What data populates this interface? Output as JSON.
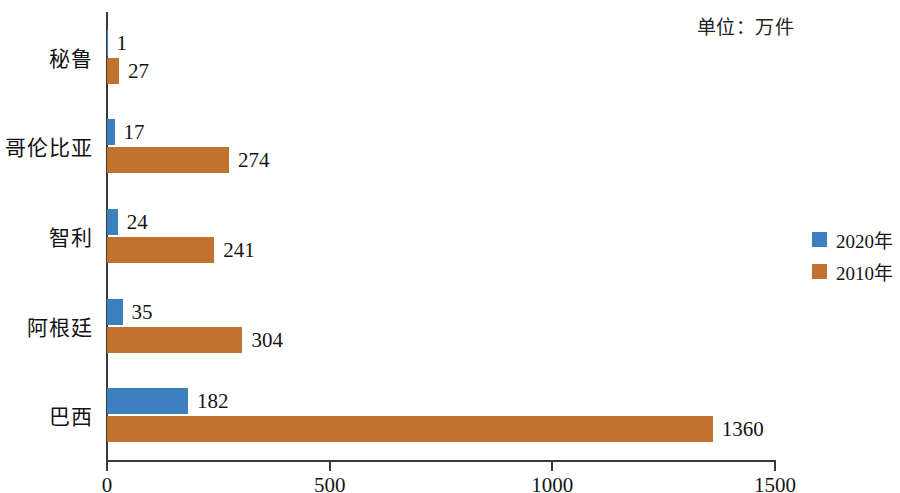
{
  "unit_note": "单位：万件",
  "legend": {
    "position": "right",
    "items": [
      {
        "label": "2020年",
        "color": "#3d80bf",
        "swatch_name": "legend-swatch-2020"
      },
      {
        "label": "2010年",
        "color": "#c2712e",
        "swatch_name": "legend-swatch-2010"
      }
    ]
  },
  "axis": {
    "x_ticks": [
      "0",
      "500",
      "1000",
      "1500"
    ],
    "x_tick_values": [
      0,
      500,
      1000,
      1500
    ]
  },
  "chart_data": {
    "type": "bar",
    "orientation": "horizontal",
    "title": "",
    "subtitle": "",
    "xlabel": "",
    "ylabel": "",
    "unit": "单位：万件",
    "xlim": [
      0,
      1500
    ],
    "grid": false,
    "legend_position": "right",
    "categories": [
      "秘鲁",
      "哥伦比亚",
      "智利",
      "阿根廷",
      "巴西"
    ],
    "series": [
      {
        "name": "2020年",
        "color": "#3d80bf",
        "values": [
          1,
          17,
          24,
          35,
          182
        ]
      },
      {
        "name": "2010年",
        "color": "#c2712e",
        "values": [
          27,
          274,
          241,
          304,
          1360
        ]
      }
    ],
    "data_labels": {
      "秘鲁": {
        "2020年": "1",
        "2010年": "27"
      },
      "哥伦比亚": {
        "2020年": "17",
        "2010年": "274"
      },
      "智利": {
        "2020年": "24",
        "2010年": "241"
      },
      "阿根廷": {
        "2020年": "35",
        "2010年": "304"
      },
      "巴西": {
        "2020年": "182",
        "2010年": "1360"
      }
    }
  }
}
